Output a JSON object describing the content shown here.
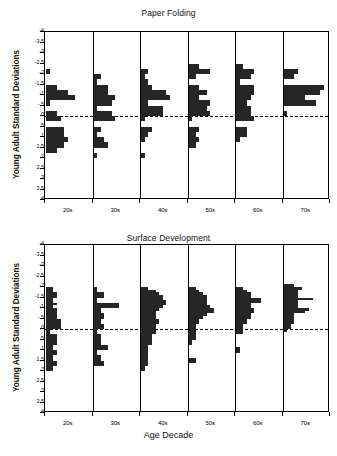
{
  "figure": {
    "xlabel": "Age Decade"
  },
  "chart_data": [
    {
      "type": "bar",
      "title": "Paper Folding",
      "xlabel": "",
      "ylabel": "Young Adult Standard Deviations",
      "orientation": "horizontal",
      "grid": false,
      "legend": null,
      "ylim": [
        -4,
        4
      ],
      "yticks": [
        -4,
        -3.5,
        -3,
        -2.5,
        -2,
        -1.5,
        -1,
        -0.5,
        0,
        0.5,
        1,
        1.5,
        2,
        2.5,
        3,
        3.5,
        4
      ],
      "ytick_labels": [
        "-4",
        "-3.5",
        "-3",
        "-2.5",
        "-2",
        "-1.5",
        "-1",
        "-.5",
        "0",
        ".5",
        "1",
        "1.5",
        "2",
        "2.5",
        "3",
        "3.5",
        "4"
      ],
      "reference_line": 0,
      "categories": [
        "20s",
        "30s",
        "40s",
        "50s",
        "60s",
        "70s"
      ],
      "bin_width": 0.25,
      "max_count": 12,
      "series": [
        {
          "name": "20s",
          "bins": [
            -2.25,
            -1.5,
            -1.25,
            -1.0,
            -0.75,
            -0.25,
            0.0,
            0.5,
            0.75,
            1.0,
            1.25,
            1.5
          ],
          "counts": [
            1,
            3,
            6,
            8,
            1,
            3,
            4,
            5,
            5,
            6,
            5,
            3
          ]
        },
        {
          "name": "30s",
          "bins": [
            -2.0,
            -1.75,
            -1.5,
            -1.25,
            -1.0,
            -0.75,
            -0.5,
            -0.25,
            0.0,
            0.5,
            0.75,
            1.0,
            1.25,
            1.75
          ],
          "counts": [
            2,
            1,
            4,
            4,
            6,
            5,
            1,
            5,
            6,
            2,
            1,
            3,
            4,
            1
          ]
        },
        {
          "name": "40s",
          "bins": [
            -2.25,
            -2.0,
            -1.75,
            -1.5,
            -1.25,
            -1.0,
            -0.75,
            -0.5,
            -0.25,
            0.0,
            0.5,
            0.75,
            1.0,
            1.75
          ],
          "counts": [
            2,
            1,
            2,
            3,
            7,
            8,
            2,
            6,
            6,
            1,
            3,
            2,
            1,
            1
          ]
        },
        {
          "name": "50s",
          "bins": [
            -2.5,
            -2.25,
            -2.0,
            -1.5,
            -1.25,
            -1.0,
            -0.75,
            -0.5,
            -0.25,
            0.0,
            0.5,
            0.75,
            1.0,
            1.25
          ],
          "counts": [
            3,
            6,
            2,
            3,
            5,
            3,
            6,
            5,
            6,
            1,
            3,
            2,
            3,
            2
          ]
        },
        {
          "name": "60s",
          "bins": [
            -2.5,
            -2.25,
            -2.0,
            -1.75,
            -1.5,
            -1.25,
            -1.0,
            -0.75,
            -0.5,
            -0.25,
            0.0,
            0.5,
            0.75,
            1.0
          ],
          "counts": [
            2,
            5,
            4,
            1,
            5,
            5,
            4,
            3,
            4,
            4,
            5,
            3,
            3,
            1
          ]
        },
        {
          "name": "70s",
          "bins": [
            -2.25,
            -2.0,
            -1.5,
            -1.25,
            -1.0,
            -0.75,
            -0.25
          ],
          "counts": [
            4,
            3,
            11,
            10,
            6,
            9,
            1
          ]
        }
      ]
    },
    {
      "type": "bar",
      "title": "Surface Development",
      "xlabel": "Age Decade",
      "ylabel": "Young Adult Standard Deviations",
      "orientation": "horizontal",
      "grid": false,
      "legend": null,
      "ylim": [
        -4,
        4
      ],
      "yticks": [
        -4,
        -3.5,
        -3,
        -2.5,
        -2,
        -1.5,
        -1,
        -0.5,
        0,
        0.5,
        1,
        1.5,
        2,
        2.5,
        3,
        3.5,
        4
      ],
      "ytick_labels": [
        "-4",
        "-3.5",
        "-3",
        "-2.5",
        "-2",
        "-1.5",
        "-1",
        "-.5",
        "0",
        ".5",
        "1",
        "1.5",
        "2",
        "2.5",
        "3",
        "3.5",
        "4"
      ],
      "reference_line": 0,
      "categories": [
        "20s",
        "30s",
        "40s",
        "50s",
        "60s",
        "70s"
      ],
      "bin_width": 0.125,
      "max_count": 12,
      "series": [
        {
          "name": "20s",
          "bins": [
            -2.0,
            -1.875,
            -1.75,
            -1.625,
            -1.5,
            -1.375,
            -1.25,
            -1.125,
            -1.0,
            -0.875,
            -0.75,
            -0.625,
            -0.5,
            -0.375,
            -0.25,
            -0.125,
            0.0,
            0.125,
            0.25,
            0.375,
            0.5,
            0.625,
            0.75,
            0.875,
            1.0,
            1.125,
            1.25,
            1.375,
            1.5,
            1.625,
            1.75,
            1.875
          ],
          "counts": [
            2,
            2,
            3,
            3,
            2,
            2,
            3,
            2,
            3,
            3,
            3,
            3,
            4,
            4,
            4,
            4,
            1,
            1,
            3,
            3,
            3,
            3,
            2,
            2,
            3,
            3,
            2,
            2,
            3,
            3,
            2,
            2
          ]
        },
        {
          "name": "30s",
          "bins": [
            -2.0,
            -1.875,
            -1.75,
            -1.625,
            -1.5,
            -1.375,
            -1.25,
            -1.125,
            -1.0,
            -0.875,
            -0.75,
            -0.625,
            -0.5,
            -0.375,
            -0.25,
            -0.125,
            0.0,
            0.125,
            0.25,
            0.375,
            0.5,
            0.625,
            0.75,
            0.875,
            1.0,
            1.125,
            1.25,
            1.375,
            1.5,
            1.625
          ],
          "counts": [
            1,
            1,
            3,
            3,
            1,
            1,
            7,
            7,
            2,
            2,
            3,
            3,
            2,
            2,
            3,
            3,
            1,
            1,
            2,
            2,
            2,
            2,
            4,
            4,
            1,
            1,
            2,
            2,
            3,
            3
          ]
        },
        {
          "name": "40s",
          "bins": [
            -2.0,
            -1.875,
            -1.75,
            -1.625,
            -1.5,
            -1.375,
            -1.25,
            -1.125,
            -1.0,
            -0.875,
            -0.75,
            -0.625,
            -0.5,
            -0.375,
            -0.25,
            -0.125,
            0.0,
            0.125,
            0.25,
            0.375,
            0.5,
            0.625,
            0.75,
            0.875,
            1.0,
            1.125,
            1.25,
            1.375,
            1.5,
            1.625,
            1.75,
            1.875
          ],
          "counts": [
            2,
            4,
            5,
            6,
            6,
            7,
            7,
            6,
            5,
            4,
            4,
            4,
            5,
            5,
            4,
            4,
            4,
            4,
            3,
            3,
            3,
            3,
            2,
            2,
            2,
            2,
            2,
            2,
            2,
            2,
            1,
            1
          ]
        },
        {
          "name": "50s",
          "bins": [
            -2.0,
            -1.875,
            -1.75,
            -1.625,
            -1.5,
            -1.375,
            -1.25,
            -1.125,
            -1.0,
            -0.875,
            -0.75,
            -0.625,
            -0.5,
            -0.375,
            -0.25,
            -0.125,
            0.0,
            0.125,
            0.25,
            0.375,
            0.5,
            0.625,
            1.375,
            1.5
          ],
          "counts": [
            2,
            3,
            4,
            5,
            5,
            5,
            5,
            6,
            7,
            7,
            5,
            4,
            3,
            3,
            2,
            2,
            2,
            2,
            2,
            2,
            1,
            1,
            2,
            2
          ]
        },
        {
          "name": "60s",
          "bins": [
            -2.0,
            -1.875,
            -1.75,
            -1.625,
            -1.5,
            -1.375,
            -1.25,
            -1.125,
            -1.0,
            -0.875,
            -0.75,
            -0.625,
            -0.5,
            -0.375,
            -0.25,
            -0.125,
            0.0,
            0.125,
            0.875,
            1.0
          ],
          "counts": [
            2,
            3,
            4,
            4,
            7,
            7,
            4,
            4,
            5,
            5,
            4,
            4,
            3,
            3,
            2,
            2,
            2,
            2,
            1,
            1
          ]
        },
        {
          "name": "70s",
          "bins": [
            -2.125,
            -2.0,
            -1.875,
            -1.75,
            -1.625,
            -1.5,
            -1.375,
            -1.25,
            -1.125,
            -1.0,
            -0.875,
            -0.75,
            -0.625,
            -0.5,
            -0.375,
            -0.25,
            -0.125,
            0.0
          ],
          "counts": [
            3,
            5,
            4,
            4,
            4,
            8,
            4,
            4,
            4,
            7,
            6,
            3,
            3,
            3,
            3,
            2,
            2,
            1
          ]
        }
      ]
    }
  ]
}
